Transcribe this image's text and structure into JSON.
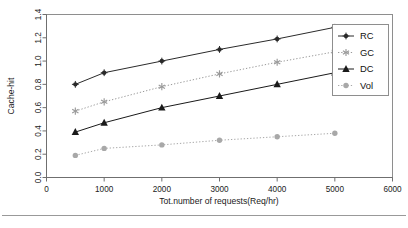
{
  "chart_data": {
    "type": "line",
    "title": "",
    "subtitle": "",
    "xlabel": "Tot.number of requests(Req/hr)",
    "ylabel": "Cache-hit",
    "x": [
      500,
      1000,
      2000,
      3000,
      4000,
      5000
    ],
    "xlim": [
      0,
      6000
    ],
    "ylim": [
      0.0,
      1.4
    ],
    "xticks": [
      0,
      1000,
      2000,
      3000,
      4000,
      5000,
      6000
    ],
    "xtick_labels": [
      "0",
      "1000",
      "2000",
      "3000",
      "4000",
      "5000",
      "6000"
    ],
    "yticks": [
      0.0,
      0.2,
      0.4,
      0.6,
      0.8,
      1.0,
      1.2,
      1.4
    ],
    "ytick_labels": [
      "0.0",
      "0.2",
      "0.4",
      "0.6",
      "0.8",
      "1.0",
      "1.2",
      "1.4"
    ],
    "grid": false,
    "legend_position": "top-right",
    "series": [
      {
        "name": "RC",
        "values": [
          0.8,
          0.9,
          1.0,
          1.1,
          1.19,
          1.29
        ],
        "marker": "diamond",
        "linestyle": "solid",
        "color": "#2b2b2b"
      },
      {
        "name": "GC",
        "values": [
          0.57,
          0.65,
          0.78,
          0.89,
          0.99,
          1.08
        ],
        "marker": "asterisk",
        "linestyle": "dotted",
        "color": "#9a9a9a"
      },
      {
        "name": "DC",
        "values": [
          0.39,
          0.47,
          0.6,
          0.7,
          0.8,
          0.9
        ],
        "marker": "triangle",
        "linestyle": "solid",
        "color": "#1a1a1a"
      },
      {
        "name": "Vol",
        "values": [
          0.19,
          0.25,
          0.28,
          0.32,
          0.35,
          0.38
        ],
        "marker": "circle",
        "linestyle": "dotted",
        "color": "#a8a8a8"
      }
    ]
  },
  "axes": {
    "ylabel": "Cache-hit",
    "xlabel": "Tot.number of requests(Req/hr)",
    "xtick_labels": [
      "0",
      "1000",
      "2000",
      "3000",
      "4000",
      "5000",
      "6000"
    ],
    "ytick_labels": [
      "0.0",
      "0.2",
      "0.4",
      "0.6",
      "0.8",
      "1.0",
      "1.2",
      "1.4"
    ]
  },
  "legend": {
    "entries": [
      {
        "label": "RC"
      },
      {
        "label": "GC"
      },
      {
        "label": "DC"
      },
      {
        "label": "Vol"
      }
    ]
  }
}
